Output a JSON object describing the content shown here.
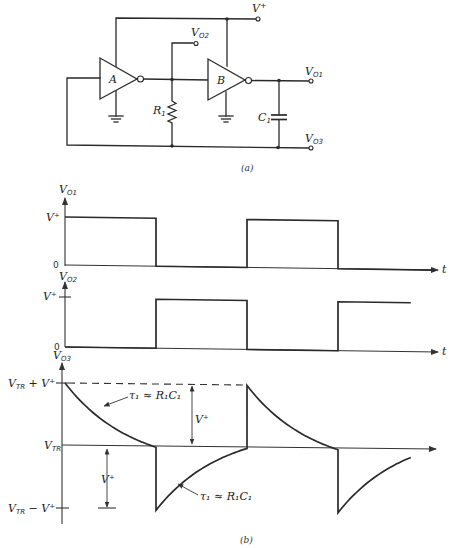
{
  "figure": {
    "part_a": {
      "caption": "(a)",
      "gates": [
        {
          "id": "A",
          "label": "A",
          "type": "inverter"
        },
        {
          "id": "B",
          "label": "B",
          "type": "inverter"
        }
      ],
      "components": [
        {
          "id": "R1",
          "label": "R",
          "sub": "1",
          "type": "resistor"
        },
        {
          "id": "C1",
          "label": "C",
          "sub": "1",
          "type": "capacitor"
        }
      ],
      "terminals": {
        "vplus": {
          "label": "V",
          "sup": "+"
        },
        "vo1": {
          "label": "V",
          "sub": "O1"
        },
        "vo2": {
          "label": "V",
          "sub": "O2"
        },
        "vo3": {
          "label": "V",
          "sub": "O3"
        }
      }
    },
    "part_b": {
      "caption": "(b)",
      "time_label": "t",
      "vo1_axis": {
        "label": "V",
        "sub": "O1",
        "high": "V⁺",
        "zero": "0"
      },
      "vo2_axis": {
        "label": "V",
        "sub": "O2",
        "high": "V⁺",
        "zero": "0"
      },
      "vo3_axis": {
        "label": "V",
        "sub": "O3",
        "top": "V",
        "top_sub": "TR",
        "top_rest": " + V⁺",
        "mid": "V",
        "mid_sub": "TR",
        "bottom": "V",
        "bottom_sub": "TR",
        "bottom_rest": " − V⁺"
      },
      "annotations": {
        "amplitude_upper": "V⁺",
        "amplitude_lower": "V⁺",
        "tau_upper": "τ₁ ≈ R₁C₁",
        "tau_lower": "τ₁ ≈ R₁C₁"
      }
    }
  },
  "chart_data": {
    "type": "line",
    "xlabel": "t",
    "series": [
      {
        "name": "V_O1",
        "levels": [
          "V+",
          "0"
        ],
        "segments": [
          {
            "t": [
              0,
              1
            ],
            "level": "V+"
          },
          {
            "t": [
              1,
              2
            ],
            "level": "0"
          },
          {
            "t": [
              2,
              3
            ],
            "level": "V+"
          },
          {
            "t": [
              3,
              4.05
            ],
            "level": "0"
          }
        ]
      },
      {
        "name": "V_O2",
        "levels": [
          "V+",
          "0"
        ],
        "segments": [
          {
            "t": [
              0,
              1
            ],
            "level": "0"
          },
          {
            "t": [
              1,
              2
            ],
            "level": "V+"
          },
          {
            "t": [
              2,
              3
            ],
            "level": "0"
          },
          {
            "t": [
              3,
              3.8
            ],
            "level": "V+"
          }
        ]
      },
      {
        "name": "V_O3",
        "levels": [
          "V_TR + V+",
          "V_TR",
          "V_TR - V+"
        ],
        "segments": [
          {
            "t": [
              0,
              1
            ],
            "shape": "exp-decay",
            "from": "V_TR + V+",
            "to": "V_TR",
            "tau": "R1C1"
          },
          {
            "t": [
              1,
              2
            ],
            "shape": "exp-rise",
            "from": "V_TR - V+",
            "to": "V_TR",
            "tau": "R1C1"
          },
          {
            "t": [
              2,
              3
            ],
            "shape": "exp-decay",
            "from": "V_TR + V+",
            "to": "V_TR",
            "tau": "R1C1"
          },
          {
            "t": [
              3,
              3.8
            ],
            "shape": "exp-rise",
            "from": "V_TR - V+",
            "to": "partial",
            "tau": "R1C1"
          }
        ]
      }
    ],
    "legend": "none",
    "grid": false
  }
}
